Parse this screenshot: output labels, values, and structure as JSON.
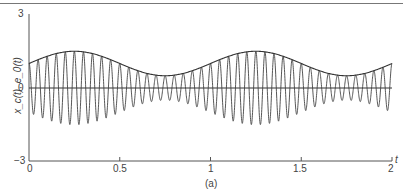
{
  "chart_data": {
    "type": "line",
    "title": "",
    "caption": "(a)",
    "xlabel": "t",
    "ylabel": "x_c(t), e_0(t)",
    "xlim": [
      0,
      2
    ],
    "ylim": [
      -3,
      3
    ],
    "x_ticks": [
      "0",
      "0.5",
      "1",
      "1.5",
      "2"
    ],
    "y_ticks": [
      "3",
      "0",
      "−3"
    ],
    "grid": false,
    "series": [
      {
        "name": "x_c(t)",
        "description": "AM signal: carrier ~20 Hz modulated by envelope 1 + 0.5 sin(2πt)",
        "carrier_freq_hz": 20,
        "envelope_offset": 1.0,
        "envelope_amplitude": 0.5,
        "envelope_freq_hz": 1
      },
      {
        "name": "e_0(t)",
        "description": "Envelope curve",
        "x": [
          0,
          0.25,
          0.5,
          0.75,
          1.0,
          1.25,
          1.5,
          1.75,
          2.0
        ],
        "values": [
          1.0,
          1.5,
          1.0,
          0.5,
          1.0,
          1.5,
          1.0,
          0.5,
          1.0
        ]
      }
    ]
  },
  "labels": {
    "y_top": "3",
    "y_zero": "0",
    "y_bottom": "−3",
    "x0": "0",
    "x05": "0.5",
    "x1": "1",
    "x15": "1.5",
    "x2": "2",
    "t": "t",
    "ylabel": "x_c(t), e_0(t)",
    "caption": "(a)"
  }
}
